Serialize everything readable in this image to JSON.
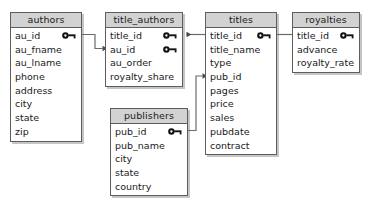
{
  "diagram": {
    "type": "entity-relationship-diagram",
    "background_color": "#ffffff",
    "header_color": "#d2d2d2",
    "border_color": "#5d5d5d",
    "text_color": "#1a1a1a",
    "connector_color": "#6b6b6b"
  },
  "entities": [
    {
      "id": "authors",
      "name": "authors",
      "x": 10,
      "y": 12,
      "width": 72,
      "fields": [
        {
          "name": "au_id",
          "key": true
        },
        {
          "name": "au_fname",
          "key": false
        },
        {
          "name": "au_lname",
          "key": false
        },
        {
          "name": "phone",
          "key": false
        },
        {
          "name": "address",
          "key": false
        },
        {
          "name": "city",
          "key": false
        },
        {
          "name": "state",
          "key": false
        },
        {
          "name": "zip",
          "key": false
        }
      ]
    },
    {
      "id": "title_authors",
      "name": "title_authors",
      "x": 105,
      "y": 12,
      "width": 78,
      "fields": [
        {
          "name": "title_id",
          "key": true
        },
        {
          "name": "au_id",
          "key": true
        },
        {
          "name": "au_order",
          "key": false
        },
        {
          "name": "royalty_share",
          "key": false
        }
      ]
    },
    {
      "id": "titles",
      "name": "titles",
      "x": 205,
      "y": 12,
      "width": 72,
      "fields": [
        {
          "name": "title_id",
          "key": true
        },
        {
          "name": "title_name",
          "key": false
        },
        {
          "name": "type",
          "key": false
        },
        {
          "name": "pub_id",
          "key": false
        },
        {
          "name": "pages",
          "key": false
        },
        {
          "name": "price",
          "key": false
        },
        {
          "name": "sales",
          "key": false
        },
        {
          "name": "pubdate",
          "key": false
        },
        {
          "name": "contract",
          "key": false
        }
      ]
    },
    {
      "id": "royalties",
      "name": "royalties",
      "x": 292,
      "y": 12,
      "width": 68,
      "fields": [
        {
          "name": "title_id",
          "key": true
        },
        {
          "name": "advance",
          "key": false
        },
        {
          "name": "royalty_rate",
          "key": false
        }
      ]
    },
    {
      "id": "publishers",
      "name": "publishers",
      "x": 110,
      "y": 108,
      "width": 78,
      "fields": [
        {
          "name": "pub_id",
          "key": true
        },
        {
          "name": "pub_name",
          "key": false
        },
        {
          "name": "city",
          "key": false
        },
        {
          "name": "state",
          "key": false
        },
        {
          "name": "country",
          "key": false
        }
      ]
    }
  ],
  "relationships": [
    {
      "id": "authors-to-title-authors",
      "from_entity": "authors",
      "from_field": "au_id",
      "to_entity": "title_authors",
      "to_field": "au_id",
      "arrow": "to"
    },
    {
      "id": "titles-to-title-authors",
      "from_entity": "titles",
      "from_field": "title_id",
      "to_entity": "title_authors",
      "to_field": "title_id",
      "arrow": "to"
    },
    {
      "id": "royalties-to-titles",
      "from_entity": "royalties",
      "from_field": "title_id",
      "to_entity": "titles",
      "to_field": "title_id",
      "arrow": "none"
    },
    {
      "id": "publishers-to-titles",
      "from_entity": "publishers",
      "from_field": "pub_id",
      "to_entity": "titles",
      "to_field": "pub_id",
      "arrow": "to"
    }
  ],
  "icons": {
    "primary_key": "key-icon"
  }
}
